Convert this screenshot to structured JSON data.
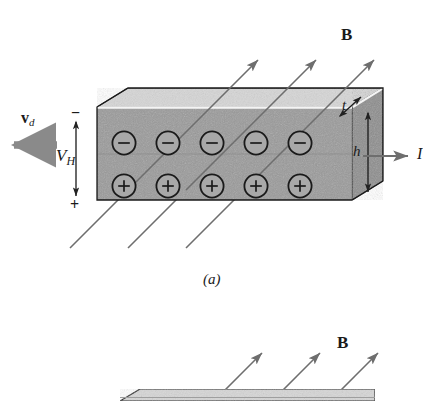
{
  "figure": {
    "panels": [
      {
        "id": "a",
        "caption": "(a)"
      },
      {
        "id": "b",
        "caption": ""
      }
    ]
  },
  "labels": {
    "magnetic_field": "B",
    "magnetic_field_b": "B",
    "drift_velocity": "v",
    "drift_velocity_sub": "d",
    "hall_voltage": "V",
    "hall_voltage_sub": "H",
    "thickness": "t",
    "height": "h",
    "current": "I",
    "sign_negative": "−",
    "sign_positive": "+",
    "charge_negative": "−",
    "charge_positive": "+"
  },
  "charges": {
    "top_row_label": "−",
    "bottom_row_label": "+",
    "top_row_count": 5,
    "bottom_row_count": 5,
    "top_row": [
      "−",
      "−",
      "−",
      "−",
      "−"
    ],
    "bottom_row": [
      "+",
      "+",
      "+",
      "+",
      "+"
    ]
  },
  "field_arrows": {
    "panel_a_count": 3,
    "panel_b_count": 3,
    "direction": "up-and-to-the-right"
  },
  "colors": {
    "slab_front": "#9a9a9a",
    "slab_top": "#d6d6d6",
    "slab_right": "#8d8d8d",
    "outline": "#1a1a1a",
    "arrow_gray": "#707070",
    "drift_arrow": "#8a8a8a",
    "highlight_edge": "#f2f2f2",
    "background": "#ffffff"
  }
}
